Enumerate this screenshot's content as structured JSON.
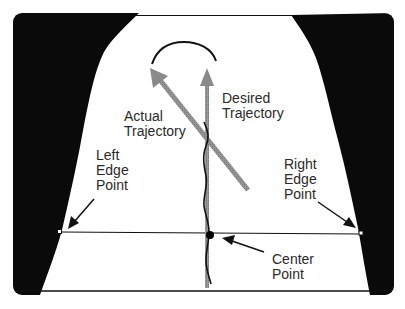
{
  "labels": {
    "desired": [
      "Desired",
      "Trajectory"
    ],
    "actual": [
      "Actual",
      "Trajectory"
    ],
    "left_edge": [
      "Left",
      "Edge",
      "Point"
    ],
    "right_edge": [
      "Right",
      "Edge",
      "Point"
    ],
    "center": [
      "Center",
      "Point"
    ]
  },
  "colors": {
    "background": "#ffffff",
    "walls": "#0a0a0a",
    "trajectory_arrow": "#8c8c8c",
    "line": "#111111"
  }
}
